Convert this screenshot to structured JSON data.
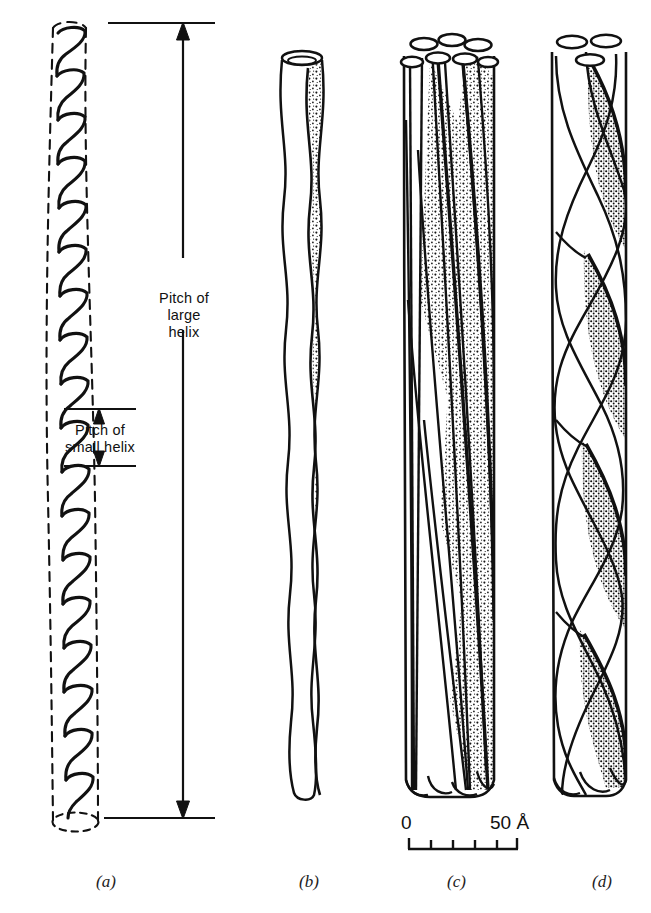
{
  "figure": {
    "annotations": {
      "pitch_large": "Pitch of\nlarge\nhelix",
      "pitch_small": "Pitch of\nsmall helix"
    },
    "scale_bar": {
      "start_label": "0",
      "end_label": "50 Å",
      "ticks": 6,
      "intervals": 5
    },
    "panels": [
      {
        "id": "a",
        "label": "(a)",
        "x": 96,
        "description": "minor helix coiled inside dashed major-helix envelope"
      },
      {
        "id": "b",
        "label": "(b)",
        "x": 299,
        "description": "single wavy strand"
      },
      {
        "id": "c",
        "label": "(c)",
        "x": 447,
        "description": "multi-strand shallow-pitch bundle"
      },
      {
        "id": "d",
        "label": "(d)",
        "x": 592,
        "description": "three-strand steeply twisted rope"
      }
    ],
    "colors": {
      "ink": "#111111",
      "paper": "#ffffff",
      "stipple": "#1a1a1a"
    }
  }
}
